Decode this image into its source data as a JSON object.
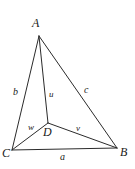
{
  "figure": {
    "type": "geometry-diagram",
    "background_color": "#ffffff",
    "stroke_color": "#2b2b2b",
    "label_color": "#1a1a1a",
    "width": 135,
    "height": 169,
    "vertices": [
      {
        "id": "A",
        "label": "A",
        "x": 39,
        "y": 36,
        "label_x": 32,
        "label_y": 17
      },
      {
        "id": "B",
        "label": "B",
        "x": 117,
        "y": 148,
        "label_x": 120,
        "label_y": 146
      },
      {
        "id": "C",
        "label": "C",
        "x": 12,
        "y": 150,
        "label_x": 2,
        "label_y": 147
      },
      {
        "id": "D",
        "label": "D",
        "x": 48,
        "y": 123,
        "label_x": 43,
        "label_y": 126
      }
    ],
    "segments": [
      {
        "id": "AC",
        "from": "A",
        "to": "C",
        "x1": 39,
        "y1": 36,
        "x2": 12,
        "y2": 150
      },
      {
        "id": "AB",
        "from": "A",
        "to": "B",
        "x1": 39,
        "y1": 36,
        "x2": 117,
        "y2": 148
      },
      {
        "id": "CB",
        "from": "C",
        "to": "B",
        "x1": 12,
        "y1": 150,
        "x2": 117,
        "y2": 148
      },
      {
        "id": "AD",
        "from": "A",
        "to": "D",
        "x1": 39,
        "y1": 36,
        "x2": 48,
        "y2": 123
      },
      {
        "id": "DC",
        "from": "D",
        "to": "C",
        "x1": 48,
        "y1": 123,
        "x2": 12,
        "y2": 150
      },
      {
        "id": "DB",
        "from": "D",
        "to": "B",
        "x1": 48,
        "y1": 123,
        "x2": 117,
        "y2": 148
      }
    ],
    "side_labels": [
      {
        "id": "a",
        "label": "a",
        "segment": "CB",
        "x": 60,
        "y": 152
      },
      {
        "id": "b",
        "label": "b",
        "segment": "AC",
        "x": 13,
        "y": 87
      },
      {
        "id": "c",
        "label": "c",
        "segment": "AB",
        "x": 84,
        "y": 85
      }
    ],
    "cevian_labels": [
      {
        "id": "u",
        "label": "u",
        "segment": "AD",
        "x": 49,
        "y": 90
      },
      {
        "id": "v",
        "label": "v",
        "segment": "DB",
        "x": 76,
        "y": 124
      },
      {
        "id": "w",
        "label": "w",
        "segment": "DC",
        "x": 28,
        "y": 123
      }
    ]
  }
}
